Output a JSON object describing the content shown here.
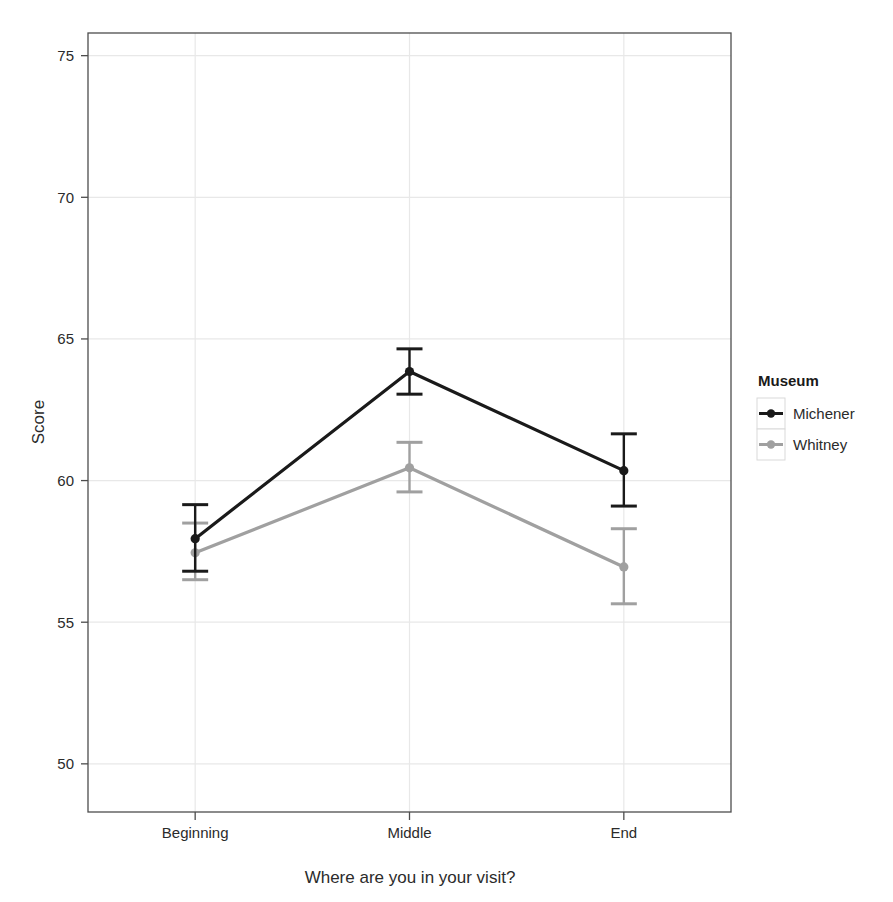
{
  "chart_data": {
    "type": "line",
    "title": "",
    "subtitle": "",
    "xlabel": "Where are you in your visit?",
    "ylabel": "Score",
    "categories": [
      "Beginning",
      "Middle",
      "End"
    ],
    "x_tick_labels": [
      "Beginning",
      "Middle",
      "End"
    ],
    "y_tick_labels": [
      "50",
      "55",
      "60",
      "65",
      "70",
      "75"
    ],
    "y_ticks": [
      50,
      55,
      60,
      65,
      70,
      75
    ],
    "ylim": [
      48.3,
      75.8
    ],
    "grid": true,
    "legend_position": "right",
    "legend_title": "Museum",
    "series": [
      {
        "name": "Michener",
        "color": "#1a1a1a",
        "values": [
          57.95,
          63.85,
          60.35
        ],
        "error_low": [
          56.8,
          63.05,
          59.1
        ],
        "error_high": [
          59.15,
          64.65,
          61.65
        ]
      },
      {
        "name": "Whitney",
        "color": "#a0a0a0",
        "values": [
          57.45,
          60.45,
          56.95
        ],
        "error_low": [
          56.5,
          59.6,
          55.65
        ],
        "error_high": [
          58.5,
          61.35,
          58.3
        ]
      }
    ]
  },
  "axes": {
    "y_axis_label": "Score",
    "x_axis_label": "Where are you in your visit?"
  },
  "legend": {
    "title": "Museum",
    "items": [
      {
        "label": "Michener",
        "color": "#1a1a1a"
      },
      {
        "label": "Whitney",
        "color": "#a0a0a0"
      }
    ]
  },
  "colors": {
    "panel_background": "#ffffff",
    "panel_border": "#4d4d4d",
    "gridline": "#e8e8e8",
    "series_michener": "#1a1a1a",
    "series_whitney": "#a0a0a0",
    "text": "#2b2b2b"
  },
  "ticks": {
    "y": [
      "75",
      "70",
      "65",
      "60",
      "55",
      "50"
    ],
    "x": [
      "Beginning",
      "Middle",
      "End"
    ]
  }
}
